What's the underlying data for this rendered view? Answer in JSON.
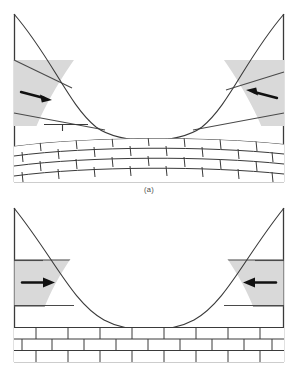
{
  "figure": {
    "background_color": "#ffffff"
  },
  "style": {
    "line_color": "#3a3a3a",
    "shading_fill": "#d9d9d9",
    "shading_stroke": "#555555",
    "arrow_color": "#111111",
    "brick_fill": "#ffffff",
    "brick_stroke": "#3a3a3a",
    "caption_color": "#4a4a4a"
  },
  "panels": [
    {
      "id": "panel-a",
      "caption": "(a)",
      "valley_profile": "parabolic-u-shaped-deep",
      "bedrock": {
        "pattern": "brick",
        "attitude": "folded-curved-synclinal",
        "rows": 4
      },
      "deposits": [
        {
          "side": "left",
          "shape": "tapering-wedge",
          "name": "left-deposit-wedge",
          "fill": "#d9d9d9",
          "arrow": {
            "name": "left-arrow",
            "direction": "right",
            "label": ""
          }
        },
        {
          "side": "right",
          "shape": "tapering-wedge",
          "name": "right-deposit-wedge",
          "fill": "#d9d9d9",
          "arrow": {
            "name": "right-arrow",
            "direction": "left",
            "label": ""
          }
        }
      ],
      "markers": [
        {
          "name": "trimline-marker",
          "type": "level-tick",
          "side": "left"
        }
      ]
    },
    {
      "id": "panel-b",
      "caption": "(b)",
      "valley_profile": "parabolic-u-shaped-shallow",
      "bedrock": {
        "pattern": "brick",
        "attitude": "horizontal-flat-lying",
        "rows": 3
      },
      "deposits": [
        {
          "side": "left",
          "shape": "horizontal-band-wedge",
          "name": "left-deposit-band",
          "fill": "#d9d9d9",
          "arrow": {
            "name": "left-arrow",
            "direction": "right",
            "label": ""
          }
        },
        {
          "side": "right",
          "shape": "horizontal-band-wedge",
          "name": "right-deposit-band",
          "fill": "#d9d9d9",
          "arrow": {
            "name": "right-arrow",
            "direction": "left",
            "label": ""
          }
        }
      ],
      "markers": []
    }
  ]
}
